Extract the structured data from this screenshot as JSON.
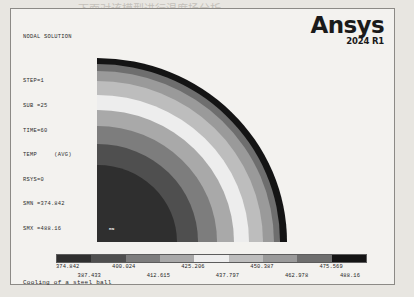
{
  "page": {
    "background_note": "scanned textbook page, grayscale ANSYS plot",
    "bleed_text": [
      {
        "text": "下面对该模型进行温度场分析",
        "x": 78,
        "y": 6,
        "size": 11
      },
      {
        "text": "Main Menu > Solution >",
        "x": 200,
        "y": 28,
        "size": 11
      },
      {
        "text": "General 1 > Constraints",
        "x": 190,
        "y": 46,
        "size": 11
      },
      {
        "text": "选择 ANSYS 中的温度载荷",
        "x": 170,
        "y": 63,
        "size": 11
      },
      {
        "text": "对话框，单击 OK 按钮即可完成",
        "x": 166,
        "y": 80,
        "size": 11
      },
      {
        "text": "的定义和施加操作。",
        "x": 170,
        "y": 97,
        "size": 11
      },
      {
        "text": "求解结果的后处理与显示",
        "x": 175,
        "y": 114,
        "size": 11
      },
      {
        "text": "温度场分布云图",
        "x": 188,
        "y": 131,
        "size": 11
      }
    ]
  },
  "frame": {
    "header": {
      "title": "NODAL SOLUTION",
      "lines": [
        "STEP=1",
        "SUB =25",
        "TIME=60",
        "TEMP     (AVG)",
        "RSYS=0",
        "SMN =374.842",
        "SMX =488.16"
      ]
    },
    "logo": {
      "name": "Ansys",
      "version": "2024 R1"
    },
    "plot": {
      "min_label": "MN",
      "max_label": "MX",
      "title": "Cooling of a steel ball"
    }
  },
  "chart_data": {
    "type": "heatmap",
    "title": "Cooling of a steel ball",
    "subtitle": "NODAL SOLUTION - TEMP (AVG)",
    "quantity": "TEMP",
    "averaging": "AVG",
    "step": 1,
    "substep": 25,
    "time": 60,
    "rsys": 0,
    "smn": 374.842,
    "smx": 488.16,
    "legend_position": "bottom",
    "grid": false,
    "tick_labels": [
      "374.842",
      "387.433",
      "400.024",
      "412.615",
      "425.206",
      "437.797",
      "450.387",
      "462.978",
      "475.569",
      "488.16"
    ],
    "tick_values": [
      374.842,
      387.433,
      400.024,
      412.615,
      425.206,
      437.797,
      450.387,
      462.978,
      475.569,
      488.16
    ],
    "band_colors": [
      "#1b1b1b",
      "#4a4a4a",
      "#7e7e7e",
      "#b0b0b0",
      "#dedede",
      "#f2f2f2",
      "#c9c9c9",
      "#949494",
      "#5a5a5a",
      "#222222"
    ],
    "bands": [
      {
        "index": 1,
        "range": [
          374.842,
          387.433
        ],
        "color": "#2f2f2f",
        "radius_frac": 0.42
      },
      {
        "index": 2,
        "range": [
          387.433,
          400.024
        ],
        "color": "#4f4f4f",
        "radius_frac": 0.53
      },
      {
        "index": 3,
        "range": [
          400.024,
          412.615
        ],
        "color": "#7d7d7d",
        "radius_frac": 0.63
      },
      {
        "index": 4,
        "range": [
          412.615,
          425.206
        ],
        "color": "#a9a9a9",
        "radius_frac": 0.72
      },
      {
        "index": 5,
        "range": [
          425.206,
          437.797
        ],
        "color": "#ededed",
        "radius_frac": 0.8
      },
      {
        "index": 6,
        "range": [
          437.797,
          450.387
        ],
        "color": "#bdbdbd",
        "radius_frac": 0.875
      },
      {
        "index": 7,
        "range": [
          450.387,
          462.978
        ],
        "color": "#9a9a9a",
        "radius_frac": 0.93
      },
      {
        "index": 8,
        "range": [
          462.978,
          475.569
        ],
        "color": "#6e6e6e",
        "radius_frac": 0.965
      },
      {
        "index": 9,
        "range": [
          475.569,
          488.16
        ],
        "color": "#141414",
        "radius_frac": 1.0
      }
    ],
    "geometry": "quarter-disc, axisymmetric sphere section",
    "xlabel": "",
    "ylabel": ""
  }
}
